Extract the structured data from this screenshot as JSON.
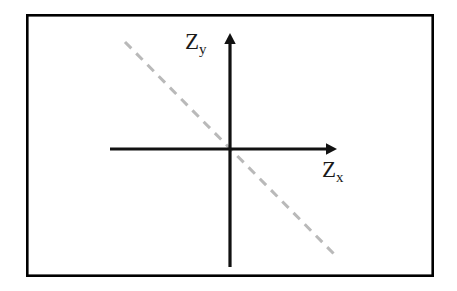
{
  "figure": {
    "width": 457,
    "height": 291,
    "background_color": "#ffffff",
    "frame": {
      "name": "figure-border",
      "color": "#000000",
      "line_width": 2.6,
      "left": 26,
      "top": 14,
      "right": 434,
      "bottom": 277
    }
  },
  "labels": {
    "y_axis": {
      "base": "Z",
      "subscript": "y"
    },
    "x_axis": {
      "base": "Z",
      "subscript": "x"
    }
  },
  "chart_data": {
    "type": "line",
    "title": "",
    "subtitle": "",
    "xlabel": "Z_x",
    "ylabel": "Z_y",
    "grid": false,
    "legend": "none",
    "annotations": [],
    "tick_labels": {
      "x": [],
      "y": []
    },
    "axes": {
      "style": "cartesian-arrows",
      "color": "#111111",
      "line_width": 3.2,
      "origin": {
        "x": 230,
        "y": 149
      },
      "x_axis": {
        "name": "x-axis",
        "from": {
          "x": 110,
          "y": 149
        },
        "to": {
          "x": 337,
          "y": 149
        },
        "arrow_at": "end",
        "arrow_size": 11
      },
      "y_axis": {
        "name": "y-axis",
        "from": {
          "x": 230,
          "y": 267
        },
        "to": {
          "x": 230,
          "y": 33
        },
        "arrow_at": "end",
        "arrow_size": 11
      }
    },
    "series": [
      {
        "name": "constraint-line",
        "style": "dashed",
        "color": "#b9b9b9",
        "line_width": 3.0,
        "dash_pattern": [
          9,
          7
        ],
        "slope": -1.0,
        "passes_through_origin": true,
        "x": [
          125,
          335
        ],
        "y": [
          42,
          255
        ],
        "points": [
          {
            "x": 125,
            "y": 42
          },
          {
            "x": 335,
            "y": 255
          }
        ]
      }
    ]
  }
}
